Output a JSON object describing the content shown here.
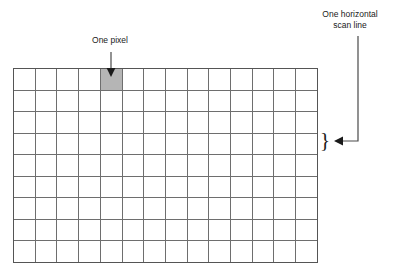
{
  "diagram": {
    "background_color": "#ffffff",
    "line_color": "#6e6e6e",
    "text_color": "#1a1a1a"
  },
  "grid": {
    "columns": 14,
    "rows": 9,
    "cell_fill": "none",
    "highlighted_cell": {
      "row": 1,
      "column": 5,
      "fill_color": "#b5b5b5",
      "name": "one-pixel"
    }
  },
  "annotations": {
    "pixel": {
      "text": "One pixel",
      "arrow": "down-arrow"
    },
    "scanline": {
      "text": "One horizontal\nscan line",
      "arrow": "left-arrow",
      "brace": "}",
      "target_row": 4
    }
  }
}
